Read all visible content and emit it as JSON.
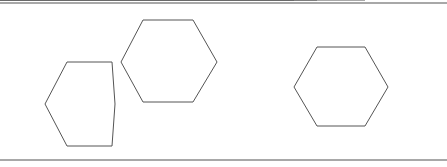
{
  "figure": {
    "background_color": "#ffffff",
    "line_color": "#555555",
    "rule_color": "#a8a8a8",
    "width": 447,
    "height": 167,
    "rules": [
      {
        "name": "top-rule",
        "y": 3,
        "x1": 0,
        "x2": 447
      },
      {
        "name": "bottom-rule",
        "y": 160,
        "x1": 0,
        "x2": 447
      }
    ],
    "shapes": [
      {
        "id": "hexagon-left",
        "label": "left hexagon",
        "orientation": "pointy-left-right",
        "center": [
          80,
          104
        ],
        "points": "67,62 112,62 115,104 112,146 67,146 45,104",
        "subdivided": false
      },
      {
        "id": "hexagon-upper-right",
        "label": "upper right hexagon",
        "orientation": "pointy-left-right",
        "center": [
          169,
          61
        ],
        "points": "143,20 193,20 217,62 193,102 143,102 121,62",
        "subdivided": false
      },
      {
        "id": "hexagon-subdivided",
        "label": "hexagon divided into six triangles",
        "orientation": "pointy-left-right",
        "center": [
          341,
          87
        ],
        "points": "317,47 365,47 388,87 365,126 317,126 294,87",
        "subdivided": true,
        "diagonals": [
          {
            "name": "diagonal-horizontal",
            "x1": 294,
            "y1": 87,
            "x2": 388,
            "y2": 87
          },
          {
            "name": "diagonal-top-left-bottom-right",
            "x1": 317,
            "y1": 47,
            "x2": 365,
            "y2": 126
          },
          {
            "name": "diagonal-top-right-bottom-left",
            "x1": 365,
            "y1": 47,
            "x2": 317,
            "y2": 126
          }
        ]
      }
    ]
  }
}
